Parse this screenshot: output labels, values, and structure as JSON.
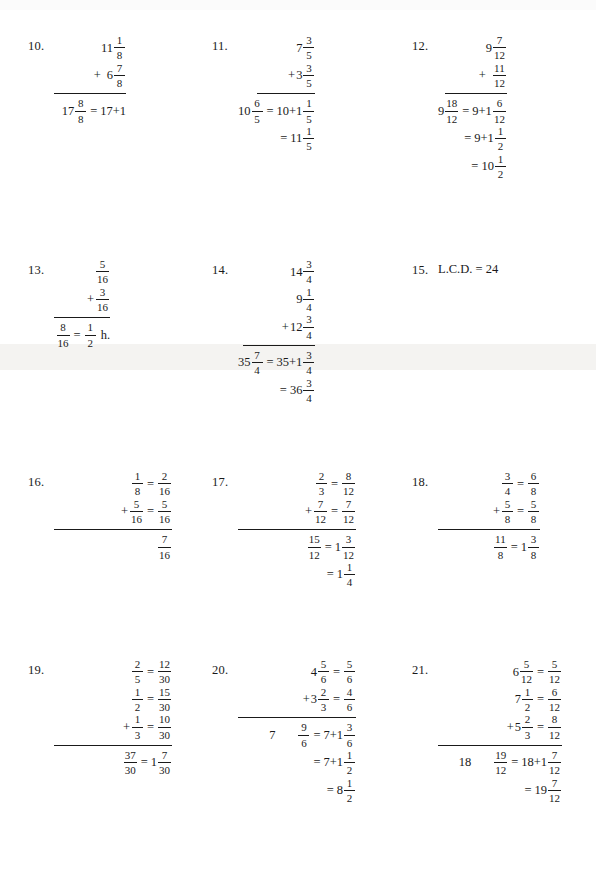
{
  "page": {
    "width": 596,
    "height": 871,
    "background": "#ffffff",
    "ink": "#1a1a1a"
  },
  "problems": [
    {
      "id": "p10",
      "number": "10.",
      "lines": [
        {
          "kind": "term",
          "op": "",
          "int": "11",
          "frac": [
            "1",
            "8"
          ]
        },
        {
          "kind": "term",
          "op": "+",
          "int": "6",
          "frac": [
            "7",
            "8"
          ],
          "opgap": true
        },
        {
          "kind": "rule",
          "width": 72
        },
        {
          "kind": "result",
          "int": "17",
          "frac": [
            "8",
            "8"
          ],
          "eq": "=",
          "tail": "17+1"
        }
      ]
    },
    {
      "id": "p11",
      "number": "11.",
      "lines": [
        {
          "kind": "term",
          "op": "",
          "int": "7",
          "frac": [
            "3",
            "5"
          ]
        },
        {
          "kind": "term",
          "op": "+",
          "int": "3",
          "frac": [
            "3",
            "5"
          ]
        },
        {
          "kind": "rule",
          "width": 58
        },
        {
          "kind": "result",
          "int": "10",
          "frac": [
            "6",
            "5"
          ],
          "eq": "=",
          "tail_int": "10+1",
          "tail_frac": [
            "1",
            "5"
          ]
        },
        {
          "kind": "cont",
          "eq": "=",
          "tail_int": "11",
          "tail_frac": [
            "1",
            "5"
          ]
        }
      ]
    },
    {
      "id": "p12",
      "number": "12.",
      "lines": [
        {
          "kind": "term",
          "op": "",
          "int": "9",
          "frac": [
            "7",
            "12"
          ]
        },
        {
          "kind": "term",
          "op": "+",
          "int": "",
          "frac": [
            "11",
            "12"
          ],
          "opgap": true
        },
        {
          "kind": "rule",
          "width": 62
        },
        {
          "kind": "result",
          "int": "9",
          "frac": [
            "18",
            "12"
          ],
          "eq": "=",
          "tail_int": "9+1",
          "tail_frac": [
            "6",
            "12"
          ]
        },
        {
          "kind": "cont",
          "eq": "=",
          "tail_int": "9+1",
          "tail_frac": [
            "1",
            "2"
          ]
        },
        {
          "kind": "cont",
          "eq": "=",
          "tail_int": "10",
          "tail_frac": [
            "1",
            "2"
          ]
        }
      ]
    },
    {
      "id": "p13",
      "number": "13.",
      "lines": [
        {
          "kind": "term",
          "op": "",
          "int": "",
          "frac": [
            "5",
            "16"
          ]
        },
        {
          "kind": "term",
          "op": "+",
          "int": "",
          "frac": [
            "3",
            "16"
          ]
        },
        {
          "kind": "rule",
          "width": 56
        },
        {
          "kind": "result",
          "int": "",
          "frac": [
            "8",
            "16"
          ],
          "eq": "=",
          "tail_frac": [
            "1",
            "2"
          ],
          "unit": "h."
        }
      ]
    },
    {
      "id": "p14",
      "number": "14.",
      "lines": [
        {
          "kind": "term",
          "op": "",
          "int": "14",
          "frac": [
            "3",
            "4"
          ]
        },
        {
          "kind": "term",
          "op": "",
          "int": "9",
          "frac": [
            "1",
            "4"
          ]
        },
        {
          "kind": "term",
          "op": "+",
          "int": "12",
          "frac": [
            "3",
            "4"
          ]
        },
        {
          "kind": "rule",
          "width": 72
        },
        {
          "kind": "result",
          "int": "35",
          "frac": [
            "7",
            "4"
          ],
          "eq": "=",
          "tail_int": "35+1",
          "tail_frac": [
            "3",
            "4"
          ]
        },
        {
          "kind": "cont",
          "eq": "=",
          "tail_int": "36",
          "tail_frac": [
            "3",
            "4"
          ]
        }
      ]
    },
    {
      "id": "p15",
      "number": "15.",
      "lines": [
        {
          "kind": "text",
          "text": "L.C.D. = 24"
        }
      ]
    },
    {
      "id": "p16",
      "number": "16.",
      "lines": [
        {
          "kind": "conv",
          "op": "",
          "frac": [
            "1",
            "8"
          ],
          "eq": "=",
          "frac2": [
            "2",
            "16"
          ]
        },
        {
          "kind": "conv",
          "op": "+",
          "frac": [
            "5",
            "16"
          ],
          "eq": "=",
          "frac2": [
            "5",
            "16"
          ]
        },
        {
          "kind": "rule",
          "width": 118
        },
        {
          "kind": "result",
          "int": "",
          "frac": [
            "7",
            "16"
          ]
        }
      ]
    },
    {
      "id": "p17",
      "number": "17.",
      "lines": [
        {
          "kind": "conv",
          "op": "",
          "frac": [
            "2",
            "3"
          ],
          "eq": "=",
          "frac2": [
            "8",
            "12"
          ]
        },
        {
          "kind": "conv",
          "op": "+",
          "frac": [
            "7",
            "12"
          ],
          "eq": "=",
          "frac2": [
            "7",
            "12"
          ]
        },
        {
          "kind": "rule",
          "width": 118
        },
        {
          "kind": "result",
          "int": "",
          "frac": [
            "15",
            "12"
          ],
          "eq": "=",
          "tail_int": "1",
          "tail_frac": [
            "3",
            "12"
          ]
        },
        {
          "kind": "cont",
          "eq": "=",
          "tail_int": "1",
          "tail_frac": [
            "1",
            "4"
          ]
        }
      ]
    },
    {
      "id": "p18",
      "number": "18.",
      "lines": [
        {
          "kind": "conv",
          "op": "",
          "frac": [
            "3",
            "4"
          ],
          "eq": "=",
          "frac2": [
            "6",
            "8"
          ]
        },
        {
          "kind": "conv",
          "op": "+",
          "frac": [
            "5",
            "8"
          ],
          "eq": "=",
          "frac2": [
            "5",
            "8"
          ]
        },
        {
          "kind": "rule",
          "width": 102
        },
        {
          "kind": "result",
          "int": "",
          "frac": [
            "11",
            "8"
          ],
          "eq": "=",
          "tail_int": "1",
          "tail_frac": [
            "3",
            "8"
          ]
        }
      ]
    },
    {
      "id": "p19",
      "number": "19.",
      "lines": [
        {
          "kind": "conv",
          "op": "",
          "frac": [
            "2",
            "5"
          ],
          "eq": "=",
          "frac2": [
            "12",
            "30"
          ]
        },
        {
          "kind": "conv",
          "op": "",
          "frac": [
            "1",
            "2"
          ],
          "eq": "=",
          "frac2": [
            "15",
            "30"
          ]
        },
        {
          "kind": "conv",
          "op": "+",
          "frac": [
            "1",
            "3"
          ],
          "eq": "=",
          "frac2": [
            "10",
            "30"
          ]
        },
        {
          "kind": "rule",
          "width": 118
        },
        {
          "kind": "result",
          "int": "",
          "frac": [
            "37",
            "30"
          ],
          "eq": "=",
          "tail_int": "1",
          "tail_frac": [
            "7",
            "30"
          ]
        }
      ]
    },
    {
      "id": "p20",
      "number": "20.",
      "lines": [
        {
          "kind": "conv",
          "op": "",
          "int": "4",
          "frac": [
            "5",
            "6"
          ],
          "eq": "=",
          "frac2": [
            "5",
            "6"
          ]
        },
        {
          "kind": "conv",
          "op": "+",
          "int": "3",
          "frac": [
            "2",
            "3"
          ],
          "eq": "=",
          "frac2": [
            "4",
            "6"
          ]
        },
        {
          "kind": "rule",
          "width": 118
        },
        {
          "kind": "result",
          "lead_int": "7",
          "spacer": true,
          "frac": [
            "9",
            "6"
          ],
          "eq": "=",
          "tail_int": "7+1",
          "tail_frac": [
            "3",
            "6"
          ]
        },
        {
          "kind": "cont",
          "eq": "=",
          "tail_int": "7+1",
          "tail_frac": [
            "1",
            "2"
          ]
        },
        {
          "kind": "cont",
          "eq": "=",
          "tail_int": "8",
          "tail_frac": [
            "1",
            "2"
          ]
        }
      ]
    },
    {
      "id": "p21",
      "number": "21.",
      "lines": [
        {
          "kind": "conv",
          "op": "",
          "int": "6",
          "frac": [
            "5",
            "12"
          ],
          "eq": "=",
          "frac2": [
            "5",
            "12"
          ]
        },
        {
          "kind": "conv",
          "op": "",
          "int": "7",
          "frac": [
            "1",
            "2"
          ],
          "eq": "=",
          "frac2": [
            "6",
            "12"
          ]
        },
        {
          "kind": "conv",
          "op": "+",
          "int": "5",
          "frac": [
            "2",
            "3"
          ],
          "eq": "=",
          "frac2": [
            "8",
            "12"
          ]
        },
        {
          "kind": "rule",
          "width": 124
        },
        {
          "kind": "result",
          "lead_int": "18",
          "spacer": true,
          "frac": [
            "19",
            "12"
          ],
          "eq": "=",
          "tail_int": "18+1",
          "tail_frac": [
            "7",
            "12"
          ]
        },
        {
          "kind": "cont",
          "eq": "=",
          "tail_int": "19",
          "tail_frac": [
            "7",
            "12"
          ]
        }
      ]
    }
  ]
}
